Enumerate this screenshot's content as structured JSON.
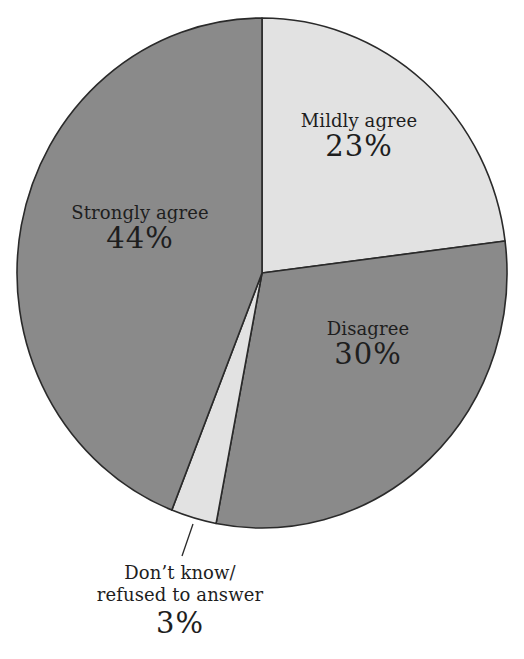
{
  "chart_data": {
    "type": "pie",
    "title": "",
    "start_angle_deg": 0,
    "direction": "clockwise",
    "slices": [
      {
        "label": "Mildly agree",
        "value": 23,
        "display": "23%",
        "color": "#e2e2e2"
      },
      {
        "label": "Disagree",
        "value": 30,
        "display": "30%",
        "color": "#8a8a8a"
      },
      {
        "label": "Don’t know/ refused to answer",
        "value": 3,
        "display": "3%",
        "color": "#e2e2e2"
      },
      {
        "label": "Strongly agree",
        "value": 44,
        "display": "44%",
        "color": "#8a8a8a"
      }
    ],
    "legend": "none",
    "label_style": "inside labels; 3% slice labeled outside with leader line"
  },
  "labels": {
    "mildly_agree": {
      "name": "Mildly agree",
      "pct": "23%"
    },
    "disagree": {
      "name": "Disagree",
      "pct": "30%"
    },
    "dont_know": {
      "line1": "Don’t know/",
      "line2": "refused to answer",
      "pct": "3%"
    },
    "strongly_agree": {
      "name": "Strongly agree",
      "pct": "44%"
    }
  },
  "colors": {
    "light_slice": "#e2e2e2",
    "dark_slice": "#8a8a8a",
    "outline": "#2a2a2a",
    "text": "#1e1e1e"
  },
  "geometry": {
    "cx": 262,
    "cy": 273,
    "rx": 245,
    "ry": 255
  }
}
